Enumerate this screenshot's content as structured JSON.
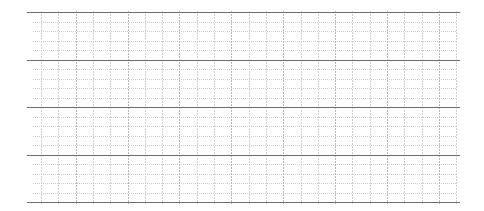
{
  "canvas": {
    "width": 484,
    "height": 211,
    "background": "#ffffff"
  },
  "grid": {
    "left": 27,
    "right": 460,
    "minor_right": 456,
    "major_rows_y": [
      12,
      59.5,
      107,
      154.5,
      202
    ],
    "minor_lines_per_band": 4,
    "vertical_start_x": 41,
    "vertical_spacing": 17.3,
    "vertical_count": 25,
    "colors": {
      "major_horizontal": "#6e6e6e",
      "minor_horizontal": "#cfcfcf",
      "vertical": "#d0d0d0",
      "vertical_dark": "#b8b8b8"
    }
  }
}
